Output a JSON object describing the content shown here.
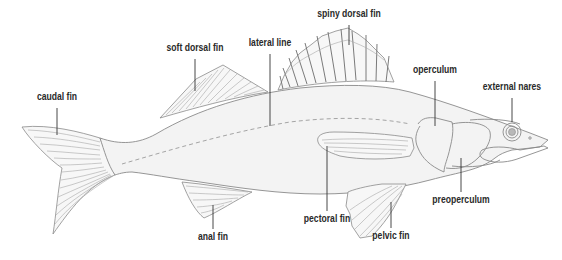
{
  "diagram": {
    "colors": {
      "background": "#ffffff",
      "body_fill": "#f3f3f3",
      "outline": "#8a8a8a",
      "label_text": "#2a2a2a",
      "leader_line": "#333333"
    },
    "labels": [
      {
        "id": "caudal-fin",
        "text": "caudal fin",
        "x": 57,
        "y": 96,
        "line": [
          57,
          108,
          57,
          135
        ]
      },
      {
        "id": "soft-dorsal-fin",
        "text": "soft dorsal fin",
        "x": 195,
        "y": 47,
        "line": [
          195,
          59,
          195,
          91
        ]
      },
      {
        "id": "lateral-line",
        "text": "lateral line",
        "x": 270,
        "y": 42,
        "line": [
          270,
          54,
          270,
          126
        ]
      },
      {
        "id": "spiny-dorsal-fin",
        "text": "spiny dorsal fin",
        "x": 349,
        "y": 13,
        "line": [
          349,
          25,
          349,
          45
        ]
      },
      {
        "id": "operculum",
        "text": "operculum",
        "x": 435,
        "y": 69,
        "line": [
          435,
          81,
          435,
          126
        ]
      },
      {
        "id": "external-nares",
        "text": "external nares",
        "x": 512,
        "y": 86,
        "line": [
          512,
          98,
          512,
          133
        ]
      },
      {
        "id": "preoperculum",
        "text": "preoperculum",
        "x": 461,
        "y": 196,
        "line": [
          461,
          158,
          461,
          192
        ]
      },
      {
        "id": "pectoral-fin",
        "text": "pectoral fin",
        "x": 327,
        "y": 215,
        "line": [
          327,
          146,
          327,
          211
        ]
      },
      {
        "id": "pelvic-fin",
        "text": "pelvic fin",
        "x": 391,
        "y": 232,
        "line": [
          391,
          202,
          391,
          228
        ]
      },
      {
        "id": "anal-fin",
        "text": "anal fin",
        "x": 213,
        "y": 233,
        "line": [
          213,
          205,
          213,
          229
        ]
      }
    ]
  }
}
